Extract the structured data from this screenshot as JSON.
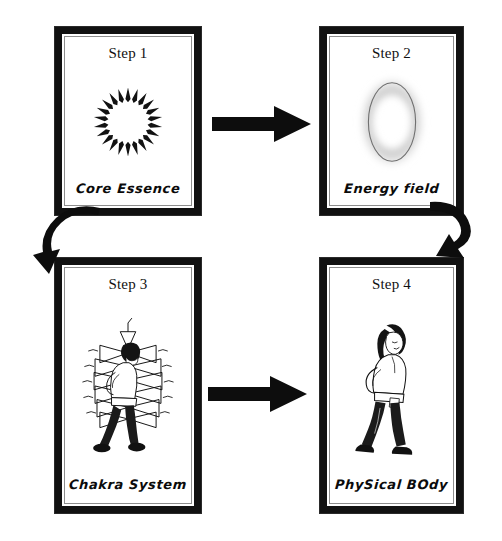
{
  "diagram": {
    "type": "flow-cycle",
    "panel_count": 4,
    "colors": {
      "ink": "#111111",
      "frame": "#111111",
      "background": "#ffffff",
      "inner_rule": "#8d8d8d",
      "aura_glow": "#b9b9b9"
    },
    "panels": [
      {
        "id": "panel-1",
        "step_title": "Step 1",
        "caption": "Core Essence",
        "illustration": "spiked-ring-icon"
      },
      {
        "id": "panel-2",
        "step_title": "Step 2",
        "caption": "Energy field",
        "illustration": "glowing-aura-ellipse-icon"
      },
      {
        "id": "panel-3",
        "step_title": "Step 3",
        "caption": "Chakra System",
        "illustration": "chakra-figure-icon"
      },
      {
        "id": "panel-4",
        "step_title": "Step 4",
        "caption": "PhySical BOdy",
        "illustration": "standing-figure-icon"
      }
    ],
    "connectors": [
      {
        "id": "arrow-1-2",
        "shape": "straight-right-arrow",
        "from": "panel-1",
        "to": "panel-2"
      },
      {
        "id": "curve-2-3",
        "shape": "curved-hook-arrow-left",
        "from": "panel-2",
        "to": "panel-3"
      },
      {
        "id": "curve-x-3",
        "shape": "curved-hook-arrow-down",
        "from": "panel-2",
        "to": "panel-3"
      },
      {
        "id": "arrow-3-4",
        "shape": "straight-right-arrow",
        "from": "panel-3",
        "to": "panel-4"
      }
    ]
  }
}
